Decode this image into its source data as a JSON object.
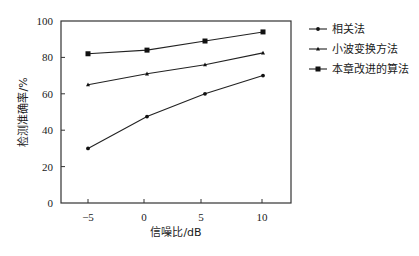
{
  "chart_data": {
    "type": "line",
    "title": "",
    "xlabel": "信噪比/dB",
    "ylabel": "检测准确率/%",
    "x": [
      -5,
      0,
      5,
      10
    ],
    "x_ticks": [
      "-5",
      "0",
      "5",
      "10"
    ],
    "y_ticks": [
      "0",
      "20",
      "40",
      "60",
      "80",
      "100"
    ],
    "xlim": [
      -7.5,
      12
    ],
    "ylim": [
      0,
      100
    ],
    "grid": false,
    "legend_position": "right-outside-top",
    "series": [
      {
        "name": "相关法",
        "marker": "dot",
        "values": [
          30,
          47.5,
          60,
          70
        ]
      },
      {
        "name": "小波变换方法",
        "marker": "triangle",
        "values": [
          65,
          71,
          76,
          82.5
        ]
      },
      {
        "name": "本章改进的算法",
        "marker": "square",
        "values": [
          82,
          84,
          89,
          94
        ]
      }
    ]
  },
  "colors": {
    "line": "#222222",
    "axis": "#333333",
    "background": "#ffffff"
  }
}
